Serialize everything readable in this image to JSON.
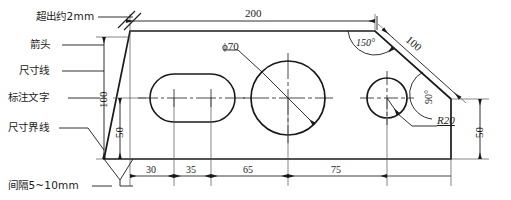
{
  "drawing": {
    "title": "Dimension annotation demonstration drawing",
    "annotation_labels": [
      {
        "name": "overshoot",
        "text": "超出约2mm"
      },
      {
        "name": "arrowhead",
        "text": "箭头"
      },
      {
        "name": "dimension-line",
        "text": "尺寸线"
      },
      {
        "name": "dimension-text",
        "text": "标注文字"
      },
      {
        "name": "extension-line",
        "text": "尺寸界线"
      },
      {
        "name": "gap",
        "text": "间隔5~10mm"
      }
    ],
    "dimensions": {
      "top_overall": "200",
      "left_height": "100",
      "left_inner_height": "50",
      "right_height": "50",
      "slant_length": "100",
      "bottom": [
        "30",
        "35",
        "65",
        "75"
      ],
      "circle_diameter": "ϕ70",
      "circle_radius": "R20",
      "angle_top": "150°",
      "angle_right": "90°"
    },
    "colors": {
      "line": "#1a1a1a",
      "thin_line": "#555555",
      "background": "#ffffff"
    }
  }
}
